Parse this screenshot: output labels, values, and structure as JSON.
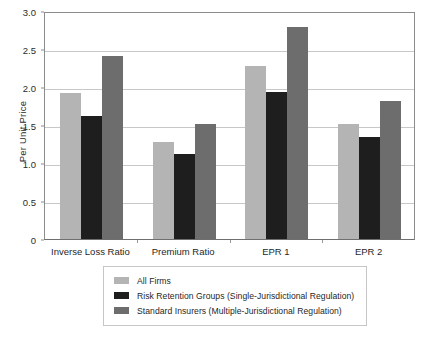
{
  "chart_data": {
    "type": "bar",
    "title": "",
    "xlabel": "",
    "ylabel": "Per Unit Price",
    "categories": [
      "Inverse Loss Ratio",
      "Premium Ratio",
      "EPR 1",
      "EPR 2"
    ],
    "series": [
      {
        "name": "All Firms",
        "color": "#b4b4b4",
        "values": [
          1.92,
          1.28,
          2.27,
          1.51
        ]
      },
      {
        "name": "Risk Retention Groups (Single-Jurisdictional Regulation)",
        "color": "#1e1e1e",
        "values": [
          1.62,
          1.12,
          1.94,
          1.34
        ]
      },
      {
        "name": "Standard Insurers (Multiple-Jurisdictional Regulation)",
        "color": "#6d6d6d",
        "values": [
          2.41,
          1.51,
          2.79,
          1.82
        ]
      }
    ],
    "ylim": [
      0,
      3.0
    ],
    "yticks": [
      0,
      0.5,
      1.0,
      1.5,
      2.0,
      2.5,
      3.0
    ],
    "ytick_labels": [
      "0",
      "0.5",
      "1.0",
      "1.5",
      "2.0",
      "2.5",
      "3.0"
    ],
    "grid": true,
    "legend_position": "bottom"
  }
}
